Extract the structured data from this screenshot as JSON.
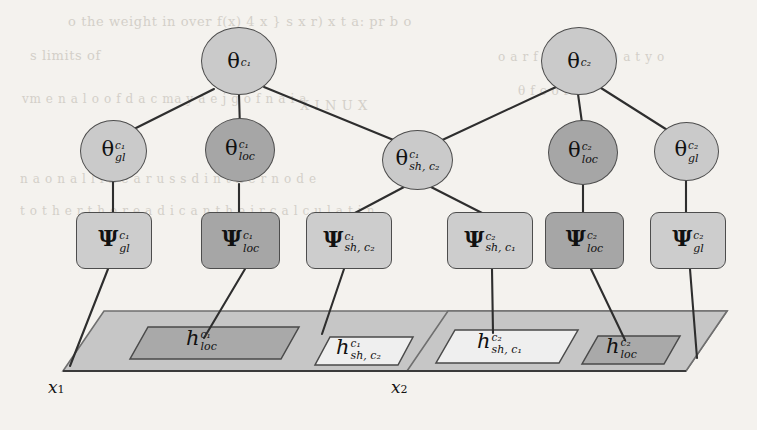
{
  "figure": {
    "type": "probabilistic-graphical-model",
    "background_color": "#f4f2ee",
    "edge_color": "#2e2e2e",
    "colors": {
      "node_light": "#cacaca",
      "node_dark": "#a6a6a6",
      "plate": "#c6c6c6",
      "h_dark": "#a9a9a9",
      "h_light": "#efefef",
      "outline": "#4d4d4d"
    }
  },
  "nodes": {
    "theta_c1": {
      "glyph": "θ",
      "sup": "c₁",
      "sub": ""
    },
    "theta_c2": {
      "glyph": "θ",
      "sup": "c₂",
      "sub": ""
    },
    "theta_gl_c1": {
      "glyph": "θ",
      "sup": "c₁",
      "sub": "gl"
    },
    "theta_loc_c1": {
      "glyph": "θ",
      "sup": "c₁",
      "sub": "loc"
    },
    "theta_sh_c1c2": {
      "glyph": "θ",
      "sup": "c₁",
      "sub": "sh, c₂"
    },
    "theta_loc_c2": {
      "glyph": "θ",
      "sup": "c₂",
      "sub": "loc"
    },
    "theta_gl_c2": {
      "glyph": "θ",
      "sup": "c₂",
      "sub": "gl"
    },
    "psi_gl_c1": {
      "glyph": "Ψ",
      "sup": "c₁",
      "sub": "gl"
    },
    "psi_loc_c1": {
      "glyph": "Ψ",
      "sup": "c₁",
      "sub": "loc"
    },
    "psi_sh_c1c2": {
      "glyph": "Ψ",
      "sup": "c₁",
      "sub": "sh, c₂"
    },
    "psi_sh_c2c1": {
      "glyph": "Ψ",
      "sup": "c₂",
      "sub": "sh, c₁"
    },
    "psi_loc_c2": {
      "glyph": "Ψ",
      "sup": "c₂",
      "sub": "loc"
    },
    "psi_gl_c2": {
      "glyph": "Ψ",
      "sup": "c₂",
      "sub": "gl"
    },
    "h_loc_c1": {
      "glyph": "h",
      "sup": "c₁",
      "sub": "loc"
    },
    "h_sh_c1c2": {
      "glyph": "h",
      "sup": "c₁",
      "sub": "sh, c₂"
    },
    "h_sh_c2c1": {
      "glyph": "h",
      "sup": "c₂",
      "sub": "sh, c₁"
    },
    "h_loc_c2": {
      "glyph": "h",
      "sup": "c₂",
      "sub": "loc"
    }
  },
  "plates": {
    "left": {
      "label": "x",
      "label_sub": "1"
    },
    "right": {
      "label": "x",
      "label_sub": "2"
    }
  },
  "ghost_text": [
    {
      "text": "o the weight in over f(x) 4 x  } s x  r) x t  a: pr  b  o",
      "x": 68,
      "y": 22,
      "size": 13
    },
    {
      "text": "s  limits of",
      "x": 30,
      "y": 56,
      "size": 13
    },
    {
      "text": "vm  e  n  a  l  o  o  f  d  a  c  ma y  a  e  j  g  o f  n  a  i  a",
      "x": 22,
      "y": 100,
      "size": 12
    },
    {
      "text": "X  I  N  U  X",
      "x": 300,
      "y": 106,
      "size": 13
    },
    {
      "text": "o  a  r  f  a  y  n  y  ( 2 )  a  t  y  o",
      "x": 498,
      "y": 58,
      "size": 12
    },
    {
      "text": "θ  f  c  o  r",
      "x": 518,
      "y": 92,
      "size": 12
    },
    {
      "text": "n  a  o  n  a  l  l  i  n  e  a  r  u  s  s  d  i  n  t  h  e  r  n  o  d  e",
      "x": 20,
      "y": 180,
      "size": 12
    },
    {
      "text": "t  o  t  h  e  r  t  h  e  r  e  a  d  i  c  a  n  t  h  e  i  r  c  a  l  c  u  l  a  t  i  n",
      "x": 20,
      "y": 212,
      "size": 12
    }
  ]
}
